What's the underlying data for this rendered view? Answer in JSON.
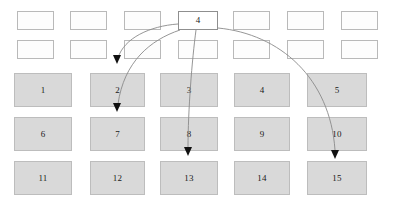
{
  "figure": {
    "name": "schedule-grid-diagram",
    "background_color": "#ffffff"
  },
  "top_rows": {
    "row_1": {
      "name": "upper-empty-row",
      "cells": [
        {
          "label": "",
          "x": 17,
          "y": 11,
          "w": 37,
          "h": 19,
          "kind": "empty"
        },
        {
          "label": "",
          "x": 70,
          "y": 11,
          "w": 37,
          "h": 19,
          "kind": "empty"
        },
        {
          "label": "",
          "x": 124,
          "y": 11,
          "w": 37,
          "h": 19,
          "kind": "empty"
        },
        {
          "label": "4",
          "x": 178,
          "y": 11,
          "w": 40,
          "h": 19,
          "kind": "label"
        },
        {
          "label": "",
          "x": 233,
          "y": 11,
          "w": 37,
          "h": 19,
          "kind": "empty"
        },
        {
          "label": "",
          "x": 287,
          "y": 11,
          "w": 37,
          "h": 19,
          "kind": "empty"
        },
        {
          "label": "",
          "x": 341,
          "y": 11,
          "w": 37,
          "h": 19,
          "kind": "empty"
        }
      ]
    },
    "row_2": {
      "name": "lower-empty-row",
      "cells": [
        {
          "label": "",
          "x": 17,
          "y": 40,
          "w": 37,
          "h": 19,
          "kind": "empty"
        },
        {
          "label": "",
          "x": 70,
          "y": 40,
          "w": 37,
          "h": 19,
          "kind": "empty"
        },
        {
          "label": "",
          "x": 124,
          "y": 40,
          "w": 37,
          "h": 19,
          "kind": "empty"
        },
        {
          "label": "",
          "x": 178,
          "y": 40,
          "w": 40,
          "h": 19,
          "kind": "empty"
        },
        {
          "label": "",
          "x": 233,
          "y": 40,
          "w": 37,
          "h": 19,
          "kind": "empty"
        },
        {
          "label": "",
          "x": 287,
          "y": 40,
          "w": 37,
          "h": 19,
          "kind": "empty"
        },
        {
          "label": "",
          "x": 341,
          "y": 40,
          "w": 37,
          "h": 19,
          "kind": "empty"
        }
      ]
    }
  },
  "grid": {
    "name": "numbered-grid",
    "rows": [
      {
        "row_index": 1,
        "cells": [
          {
            "label": "1",
            "x": 14,
            "y": 73,
            "w": 58,
            "h": 34
          },
          {
            "label": "2",
            "x": 90,
            "y": 73,
            "w": 55,
            "h": 34
          },
          {
            "label": "3",
            "x": 160,
            "y": 73,
            "w": 58,
            "h": 34
          },
          {
            "label": "4",
            "x": 234,
            "y": 73,
            "w": 56,
            "h": 34
          },
          {
            "label": "5",
            "x": 307,
            "y": 73,
            "w": 60,
            "h": 34
          }
        ]
      },
      {
        "row_index": 2,
        "cells": [
          {
            "label": "6",
            "x": 14,
            "y": 117,
            "w": 58,
            "h": 34
          },
          {
            "label": "7",
            "x": 90,
            "y": 117,
            "w": 55,
            "h": 34
          },
          {
            "label": "8",
            "x": 160,
            "y": 117,
            "w": 58,
            "h": 34
          },
          {
            "label": "9",
            "x": 234,
            "y": 117,
            "w": 56,
            "h": 34
          },
          {
            "label": "10",
            "x": 307,
            "y": 117,
            "w": 60,
            "h": 34
          }
        ]
      },
      {
        "row_index": 3,
        "cells": [
          {
            "label": "11",
            "x": 14,
            "y": 161,
            "w": 58,
            "h": 34
          },
          {
            "label": "12",
            "x": 90,
            "y": 161,
            "w": 55,
            "h": 34
          },
          {
            "label": "13",
            "x": 160,
            "y": 161,
            "w": 58,
            "h": 34
          },
          {
            "label": "14",
            "x": 234,
            "y": 161,
            "w": 56,
            "h": 34
          },
          {
            "label": "15",
            "x": 307,
            "y": 161,
            "w": 60,
            "h": 34
          }
        ]
      }
    ]
  },
  "edges": {
    "name": "curved-connector-arrows",
    "stroke_color": "#8a8a8a",
    "arrowhead_color": "#111111",
    "items": [
      {
        "name": "edge-4-to-2",
        "from": "4",
        "to": "2",
        "path": "M 178 24 C 150 26 124 38 118 58",
        "head_x": 117,
        "head_y": 64,
        "head_angle": 90
      },
      {
        "name": "edge-4-to-7",
        "from": "4",
        "to": "7",
        "path": "M 180 30 C 150 40 124 62 118 104",
        "head_x": 117,
        "head_y": 112,
        "head_angle": 90
      },
      {
        "name": "edge-4-to-13",
        "from": "4",
        "to": "13",
        "path": "M 196 30 C 192 60 188 110 188 148",
        "head_x": 188,
        "head_y": 156,
        "head_angle": 90
      },
      {
        "name": "edge-4-to-15",
        "from": "4",
        "to": "15",
        "path": "M 218 28 C 280 34 330 78 335 150",
        "head_x": 335,
        "head_y": 159,
        "head_angle": 90
      }
    ]
  }
}
